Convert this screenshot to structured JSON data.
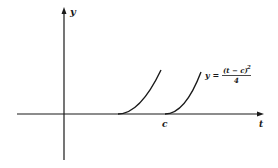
{
  "diagram": {
    "axes": {
      "x_label": "t",
      "y_label": "y",
      "color": "#1a1a1a"
    },
    "curves": [
      {
        "name": "unshifted-parabola",
        "description": "y = t^2/4 starting at origin offset (shown starting before c)"
      },
      {
        "name": "shifted-parabola",
        "description": "y = (t - c)^2 / 4 starting at t = c"
      }
    ],
    "tick_label": "c",
    "formula": {
      "lhs": "y =",
      "numerator": "(t − c)",
      "exponent": "2",
      "denominator": "4"
    }
  }
}
